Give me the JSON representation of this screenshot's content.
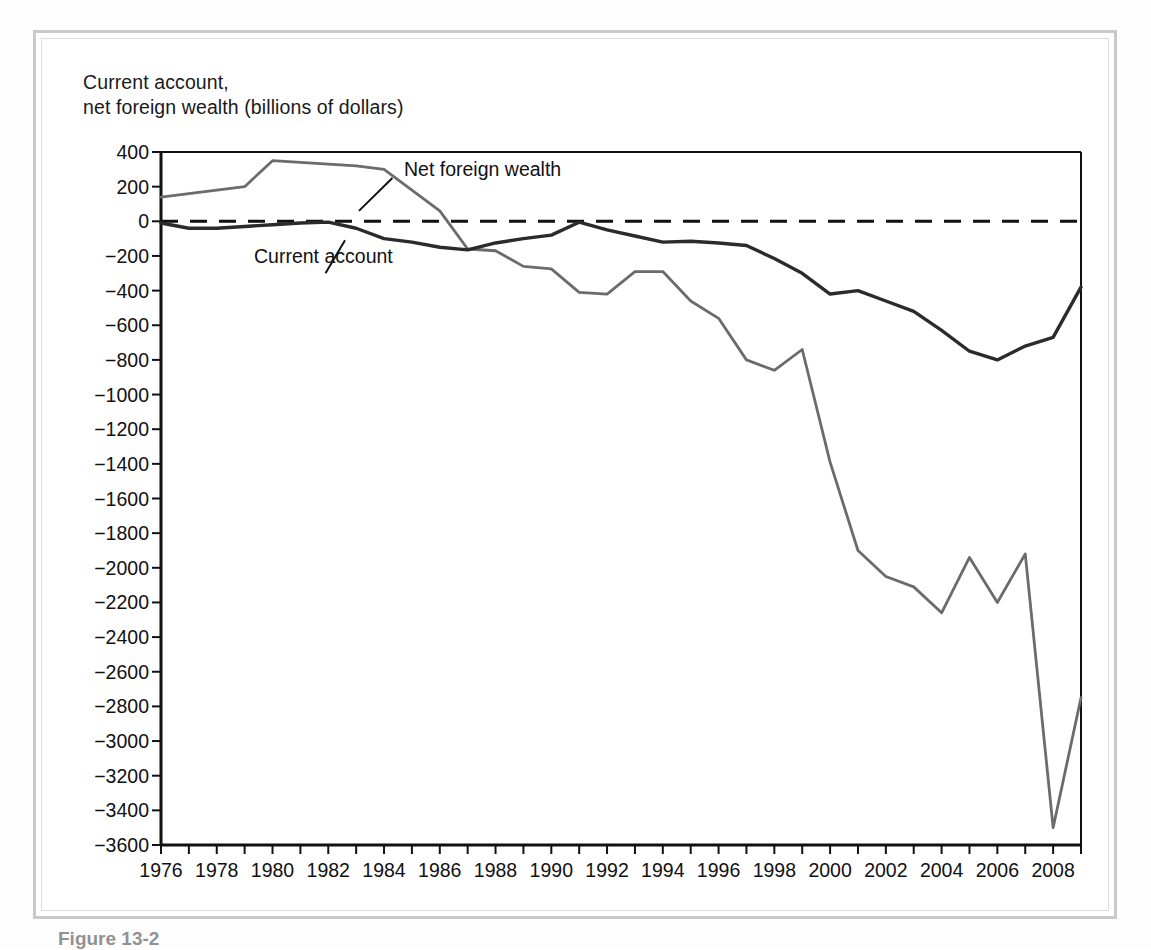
{
  "figure": {
    "caption": "Figure 13-2",
    "title_line1": "Current account,",
    "title_line2": "net foreign wealth (billions of dollars)"
  },
  "annotations": {
    "net_foreign_wealth": "Net foreign wealth",
    "current_account": "Current account"
  },
  "colors": {
    "net_foreign_wealth_line": "#6b6b6b",
    "current_account_line": "#2b2b2b",
    "zero_line": "#111111",
    "axis": "#111111",
    "frame": "#c9c9c9",
    "background": "#ffffff"
  },
  "chart_data": {
    "type": "line",
    "title": "Current account, net foreign wealth (billions of dollars)",
    "xlabel": "",
    "ylabel": "Current account, net foreign wealth (billions of dollars)",
    "xlim": [
      1976,
      2009
    ],
    "ylim": [
      -3600,
      400
    ],
    "ytick_step": 200,
    "yticks": [
      400,
      200,
      0,
      -200,
      -400,
      -600,
      -800,
      -1000,
      -1200,
      -1400,
      -1600,
      -1800,
      -2000,
      -2200,
      -2400,
      -2600,
      -2800,
      -3000,
      -3200,
      -3400,
      -3600
    ],
    "ytick_labels": [
      "400",
      "200",
      "0",
      "−200",
      "−400",
      "−600",
      "−800",
      "−1000",
      "−1200",
      "−1400",
      "−1600",
      "−1800",
      "−2000",
      "−2200",
      "−2400",
      "−2600",
      "−2800",
      "−3000",
      "−3200",
      "−3400",
      "−3600"
    ],
    "xticks": [
      1976,
      1977,
      1978,
      1979,
      1980,
      1981,
      1982,
      1983,
      1984,
      1985,
      1986,
      1987,
      1988,
      1989,
      1990,
      1991,
      1992,
      1993,
      1994,
      1995,
      1996,
      1997,
      1998,
      1999,
      2000,
      2001,
      2002,
      2003,
      2004,
      2005,
      2006,
      2007,
      2008,
      2009
    ],
    "xtick_labels_shown": [
      "1976",
      "1978",
      "1980",
      "1982",
      "1984",
      "1986",
      "1988",
      "1990",
      "1992",
      "1994",
      "1996",
      "1998",
      "2000",
      "2002",
      "2004",
      "2006",
      "2008"
    ],
    "grid": false,
    "legend": "inline-annotations",
    "zero_reference_line": 0,
    "x": [
      1976,
      1977,
      1978,
      1979,
      1980,
      1981,
      1982,
      1983,
      1984,
      1985,
      1986,
      1987,
      1988,
      1989,
      1990,
      1991,
      1992,
      1993,
      1994,
      1995,
      1996,
      1997,
      1998,
      1999,
      2000,
      2001,
      2002,
      2003,
      2004,
      2005,
      2006,
      2007,
      2008,
      2009
    ],
    "series": [
      {
        "name": "Net foreign wealth",
        "color": "#6b6b6b",
        "values": [
          140,
          160,
          180,
          200,
          350,
          340,
          330,
          320,
          300,
          180,
          60,
          -160,
          -170,
          -260,
          -275,
          -410,
          -420,
          -290,
          -290,
          -460,
          -560,
          -800,
          -860,
          -740,
          -1390,
          -1900,
          -2050,
          -2110,
          -2260,
          -1940,
          -2200,
          -1920,
          -3500,
          -2750
        ]
      },
      {
        "name": "Current account",
        "color": "#2b2b2b",
        "values": [
          -10,
          -40,
          -40,
          -30,
          -20,
          -10,
          -5,
          -40,
          -100,
          -120,
          -150,
          -165,
          -125,
          -100,
          -80,
          -5,
          -50,
          -85,
          -120,
          -115,
          -125,
          -140,
          -215,
          -300,
          -420,
          -400,
          -460,
          -520,
          -630,
          -750,
          -800,
          -720,
          -670,
          -380
        ]
      }
    ]
  }
}
